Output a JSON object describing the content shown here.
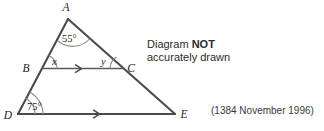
{
  "figure": {
    "type": "geometry-diagram",
    "vertices": [
      {
        "id": "A",
        "label": "A",
        "x": 68,
        "y": 19,
        "label_x": 66,
        "label_y": 11
      },
      {
        "id": "B",
        "label": "B",
        "x": 42,
        "y": 68,
        "label_x": 26,
        "label_y": 72
      },
      {
        "id": "C",
        "label": "C",
        "x": 124,
        "y": 69,
        "label_x": 129,
        "label_y": 68
      },
      {
        "id": "D",
        "label": "D",
        "x": 18,
        "y": 114,
        "label_x": 6,
        "label_y": 119
      },
      {
        "id": "E",
        "label": "E",
        "x": 175,
        "y": 114,
        "label_x": 181,
        "label_y": 118
      }
    ],
    "segments": [
      {
        "name": "side-AD-extended",
        "from": "A",
        "to": "D"
      },
      {
        "name": "side-AE-extended",
        "from": "A",
        "to": "E"
      },
      {
        "name": "base-DE",
        "from": "D",
        "to": "E"
      },
      {
        "name": "transversal-BC",
        "from": "B",
        "to": "C"
      }
    ],
    "parallel_marks": [
      {
        "name": "arrow-on-BC",
        "x": 80,
        "y": 68.6
      },
      {
        "name": "arrow-on-DE",
        "x": 98,
        "y": 114
      }
    ],
    "angles": [
      {
        "name": "angle-at-A",
        "vertex": "A",
        "label": "55°",
        "label_x": 62,
        "label_y": 42,
        "type": "measure"
      },
      {
        "name": "angle-at-B",
        "vertex": "B",
        "label": "x",
        "label_x": 52,
        "label_y": 65,
        "type": "variable"
      },
      {
        "name": "angle-at-C",
        "vertex": "C",
        "label": "y",
        "label_x": 103,
        "label_y": 65,
        "type": "variable"
      },
      {
        "name": "angle-at-D",
        "vertex": "D",
        "label": "75°",
        "label_x": 27,
        "label_y": 110,
        "type": "measure"
      }
    ]
  },
  "note": {
    "line1_prefix": "Diagram ",
    "line1_emphasis": "NOT",
    "line2": "accurately drawn"
  },
  "source": {
    "reference": "(1384 November 1996)"
  },
  "colors": {
    "background": "#ffffff",
    "line": "#4a4a4a",
    "arc": "#8a8a8a",
    "text": "#2b2b2b"
  }
}
